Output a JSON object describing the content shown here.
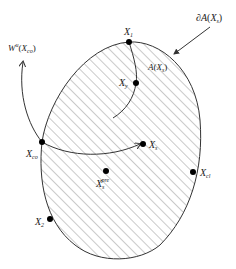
{
  "diagram": {
    "region_label": "A(X_s)",
    "boundary_label": "∂A(X_s)",
    "manifold_label": "W^u(X_co)",
    "points": [
      {
        "id": "X1",
        "label": "X",
        "sub": "1",
        "sup": ""
      },
      {
        "id": "Xy",
        "label": "X",
        "sub": "y",
        "sup": ""
      },
      {
        "id": "Xco",
        "label": "X",
        "sub": "co",
        "sup": ""
      },
      {
        "id": "Xs",
        "label": "X",
        "sub": "s",
        "sup": ""
      },
      {
        "id": "Xspre",
        "label": "X",
        "sub": "s",
        "sup": "pre"
      },
      {
        "id": "Xcl",
        "label": "X",
        "sub": "cl",
        "sup": ""
      },
      {
        "id": "X2",
        "label": "X",
        "sub": "2",
        "sup": ""
      }
    ],
    "colors": {
      "stroke": "#333333",
      "hatch": "#8a8a8a",
      "dot": "#000000"
    }
  }
}
